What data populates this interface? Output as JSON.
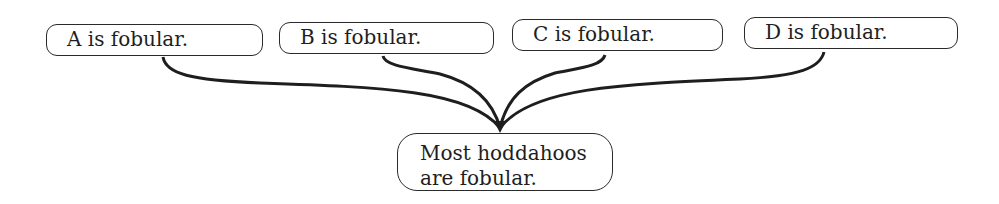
{
  "diagram": {
    "type": "argument-map",
    "premises": [
      {
        "id": "A",
        "label": "A is fobular."
      },
      {
        "id": "B",
        "label": "B is fobular."
      },
      {
        "id": "C",
        "label": "C is fobular."
      },
      {
        "id": "D",
        "label": "D is fobular."
      }
    ],
    "conclusion": {
      "line1": "Most hoddahoos",
      "line2": "are fobular."
    },
    "edges": [
      {
        "from": "A",
        "to": "conclusion"
      },
      {
        "from": "B",
        "to": "conclusion"
      },
      {
        "from": "C",
        "to": "conclusion"
      },
      {
        "from": "D",
        "to": "conclusion"
      }
    ],
    "colors": {
      "stroke": "#1e1e1e",
      "background": "#ffffff"
    }
  }
}
